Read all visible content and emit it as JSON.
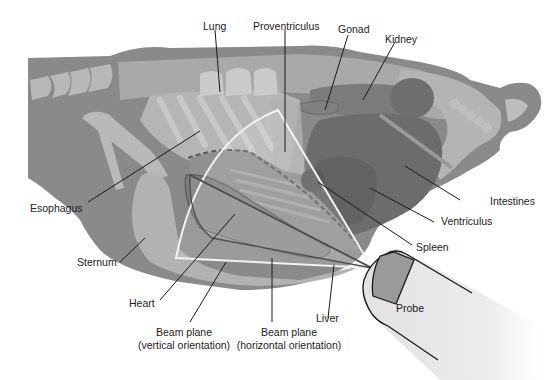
{
  "diagram": {
    "type": "anatomical-ultrasound-diagram",
    "labels": {
      "lung": "Lung",
      "proventriculus": "Proventriculus",
      "gonad": "Gonad",
      "kidney": "Kidney",
      "esophagus": "Esophagus",
      "intestines": "Intestines",
      "ventriculus": "Ventriculus",
      "spleen": "Spleen",
      "sternum": "Sternum",
      "heart": "Heart",
      "beam_vertical_line1": "Beam plane",
      "beam_vertical_line2": "(vertical orientation)",
      "beam_horizontal_line1": "Beam plane",
      "beam_horizontal_line2": "(horizontal orientation)",
      "liver": "Liver",
      "probe": "Probe"
    },
    "colors": {
      "body_dark": "#8a8a8a",
      "body_mid": "#a8a8a8",
      "bone_light": "#bdbdbd",
      "organ_dark": "#6f6f6f",
      "organ_darker": "#5e5e5e",
      "beam_outline": "#f4f4f4",
      "probe_fill": "#e6e6e6",
      "probe_window": "#9a9a9a",
      "leader_line": "#1a1a1a"
    }
  }
}
